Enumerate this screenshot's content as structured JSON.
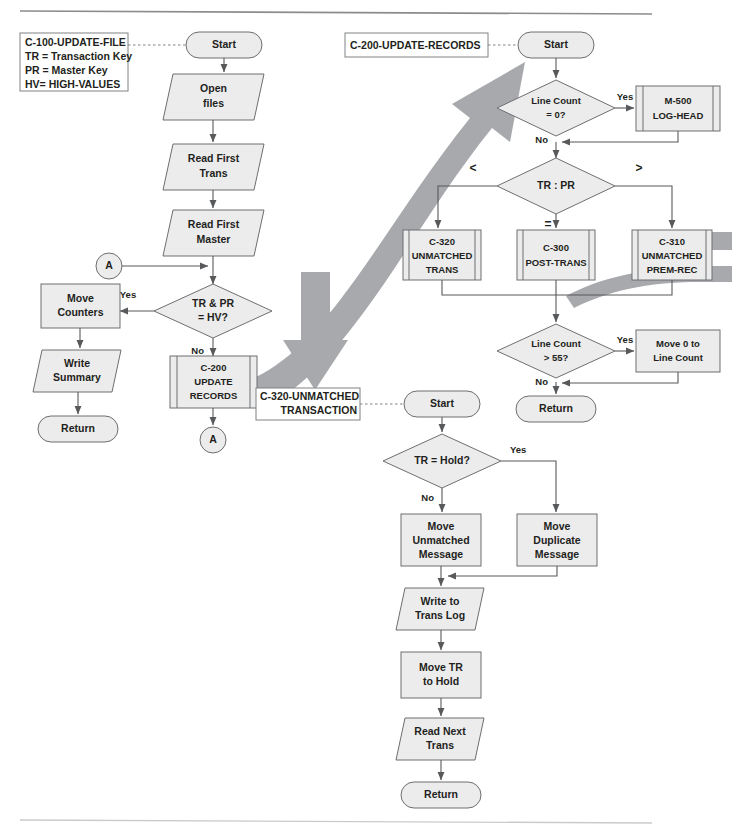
{
  "page": {
    "width": 732,
    "height": 835,
    "colors": {
      "shape_fill": "#ececed",
      "shape_stroke": "#6d6e71",
      "connector": "#58595b",
      "big_arrow": "#a7a9ac",
      "text": "#231f20",
      "rule_top": "#8a8c8e",
      "rule_bottom": "#c9cacc"
    }
  },
  "legends": [
    {
      "id": "legend-c100",
      "lines": [
        "C-100-UPDATE-FILE",
        "TR = Transaction Key",
        "PR = Master Key",
        "HV= HIGH-VALUES"
      ]
    },
    {
      "id": "legend-c200",
      "lines": [
        "C-200-UPDATE-RECORDS"
      ]
    },
    {
      "id": "legend-c320",
      "lines": [
        "C-320-UNMATCHED",
        "TRANSACTION"
      ]
    }
  ],
  "sections": {
    "c100": {
      "name": "C-100-UPDATE-FILE",
      "nodes": [
        {
          "id": "c100-start",
          "shape": "terminator",
          "label": "Start"
        },
        {
          "id": "c100-open-files",
          "shape": "io",
          "label": "Open\nfiles",
          "lines": [
            "Open",
            "files"
          ]
        },
        {
          "id": "c100-read-trans",
          "shape": "io",
          "label": "Read First\nTrans",
          "lines": [
            "Read First",
            "Trans"
          ]
        },
        {
          "id": "c100-read-master",
          "shape": "io",
          "label": "Read First\nMaster",
          "lines": [
            "Read First",
            "Master"
          ]
        },
        {
          "id": "c100-connector-a-in",
          "shape": "connector",
          "label": "A"
        },
        {
          "id": "c100-decision-hv",
          "shape": "decision",
          "label": "TR & PR\n= HV?",
          "lines": [
            "TR & PR",
            "= HV?"
          ]
        },
        {
          "id": "c100-move-counters",
          "shape": "process",
          "label": "Move\nCounters",
          "lines": [
            "Move",
            "Counters"
          ]
        },
        {
          "id": "c100-write-summary",
          "shape": "io",
          "label": "Write\nSummary",
          "lines": [
            "Write",
            "Summary"
          ]
        },
        {
          "id": "c100-return",
          "shape": "terminator",
          "label": "Return"
        },
        {
          "id": "c100-call-c200",
          "shape": "predefined",
          "label": "C-200\nUPDATE\nRECORDS",
          "lines": [
            "C-200",
            "UPDATE",
            "RECORDS"
          ]
        },
        {
          "id": "c100-connector-a-out",
          "shape": "connector",
          "label": "A"
        }
      ],
      "edge_labels": [
        {
          "id": "c100-yes",
          "text": "Yes"
        },
        {
          "id": "c100-no",
          "text": "No"
        }
      ]
    },
    "c200": {
      "name": "C-200-UPDATE-RECORDS",
      "nodes": [
        {
          "id": "c200-start",
          "shape": "terminator",
          "label": "Start"
        },
        {
          "id": "c200-decision-lc0",
          "shape": "decision",
          "label": "Line Count\n= 0?",
          "lines": [
            "Line Count",
            "= 0?"
          ]
        },
        {
          "id": "c200-call-m500",
          "shape": "predefined",
          "label": "M-500\nLOG-HEAD",
          "lines": [
            "M-500",
            "LOG-HEAD"
          ]
        },
        {
          "id": "c200-decision-trpr",
          "shape": "decision",
          "label": "TR : PR",
          "lines": [
            "TR : PR"
          ]
        },
        {
          "id": "c200-call-c320",
          "shape": "predefined",
          "label": "C-320\nUNMATCHED\nTRANS",
          "lines": [
            "C-320",
            "UNMATCHED",
            "TRANS"
          ]
        },
        {
          "id": "c200-call-c300",
          "shape": "predefined",
          "label": "C-300\nPOST-TRANS",
          "lines": [
            "C-300",
            "POST-TRANS"
          ]
        },
        {
          "id": "c200-call-c310",
          "shape": "predefined",
          "label": "C-310\nUNMATCHED\nPREM-REC",
          "lines": [
            "C-310",
            "UNMATCHED",
            "PREM-REC"
          ]
        },
        {
          "id": "c200-decision-lc55",
          "shape": "decision",
          "label": "Line Count\n> 55?",
          "lines": [
            "Line Count",
            "> 55?"
          ]
        },
        {
          "id": "c200-move-0-lc",
          "shape": "process",
          "label": "Move 0 to\nLine Count",
          "lines": [
            "Move 0 to",
            "Line Count"
          ]
        },
        {
          "id": "c200-return",
          "shape": "terminator",
          "label": "Return"
        }
      ],
      "edge_labels": [
        {
          "id": "c200-yes-1",
          "text": "Yes"
        },
        {
          "id": "c200-no-1",
          "text": "No"
        },
        {
          "id": "c200-lt",
          "text": "<"
        },
        {
          "id": "c200-gt",
          "text": ">"
        },
        {
          "id": "c200-eq",
          "text": "="
        },
        {
          "id": "c200-yes-2",
          "text": "Yes"
        },
        {
          "id": "c200-no-2",
          "text": "No"
        }
      ]
    },
    "c320": {
      "name": "C-320-UNMATCHED TRANSACTION",
      "nodes": [
        {
          "id": "c320-start",
          "shape": "terminator",
          "label": "Start"
        },
        {
          "id": "c320-decision-hold",
          "shape": "decision",
          "label": "TR = Hold?",
          "lines": [
            "TR = Hold?"
          ]
        },
        {
          "id": "c320-move-unmatched",
          "shape": "process",
          "label": "Move\nUnmatched\nMessage",
          "lines": [
            "Move",
            "Unmatched",
            "Message"
          ]
        },
        {
          "id": "c320-move-duplicate",
          "shape": "process",
          "label": "Move\nDuplicate\nMessage",
          "lines": [
            "Move",
            "Duplicate",
            "Message"
          ]
        },
        {
          "id": "c320-write-log",
          "shape": "io",
          "label": "Write to\nTrans Log",
          "lines": [
            "Write to",
            "Trans Log"
          ]
        },
        {
          "id": "c320-move-tr-hold",
          "shape": "process",
          "label": "Move TR\nto Hold",
          "lines": [
            "Move TR",
            "to Hold"
          ]
        },
        {
          "id": "c320-read-next",
          "shape": "io",
          "label": "Read Next\nTrans",
          "lines": [
            "Read Next",
            "Trans"
          ]
        },
        {
          "id": "c320-return",
          "shape": "terminator",
          "label": "Return"
        }
      ],
      "edge_labels": [
        {
          "id": "c320-yes",
          "text": "Yes"
        },
        {
          "id": "c320-no",
          "text": "No"
        }
      ]
    }
  }
}
